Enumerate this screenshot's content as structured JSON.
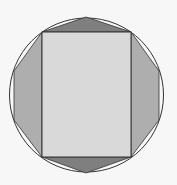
{
  "diagram": {
    "type": "geometry",
    "colors": {
      "background": "#f7f7f7",
      "rectangle_fill": "#d9d9d9",
      "side_region_fill": "#aeaeae",
      "top_bottom_region_fill": "#7f7f7f",
      "stroke": "#333333"
    },
    "circle": {
      "cx": 86.5,
      "cy": 95,
      "r": 76.5
    },
    "rectangle": {
      "x": 42,
      "y": 32,
      "width": 89,
      "height": 125
    },
    "octagon_points": [
      [
        86,
        17
      ],
      [
        131,
        32
      ],
      [
        159,
        71
      ],
      [
        159,
        120
      ],
      [
        131,
        157
      ],
      [
        86,
        173
      ],
      [
        42,
        157
      ],
      [
        14,
        120
      ],
      [
        14,
        71
      ],
      [
        42,
        32
      ]
    ]
  }
}
